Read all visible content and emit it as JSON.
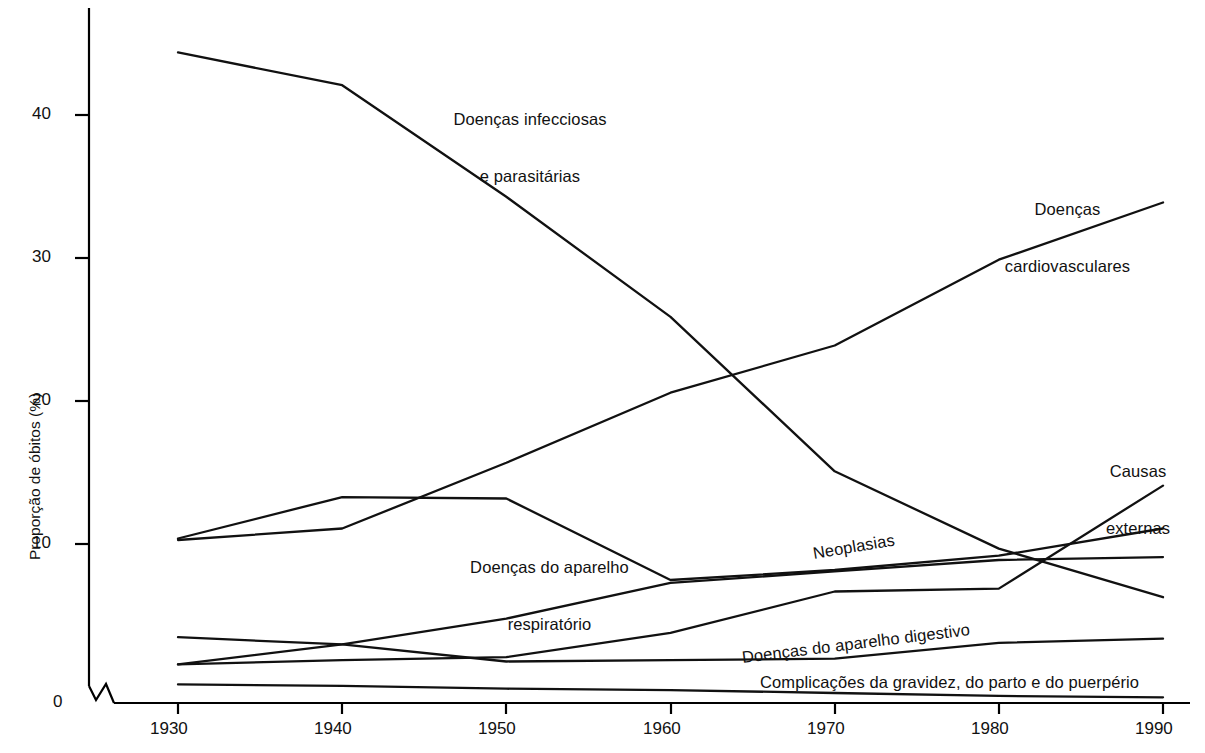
{
  "chart_data": {
    "type": "line",
    "title": "",
    "xlabel": "",
    "ylabel": "Proporção de óbitos (%)",
    "x": [
      1930,
      1940,
      1950,
      1960,
      1970,
      1980,
      1990
    ],
    "xticklabels": [
      "1930",
      "1940",
      "1950",
      "1960",
      "1970",
      "1980",
      "1990"
    ],
    "yticklabels": [
      "0",
      "10",
      "20",
      "30",
      "40"
    ],
    "yticks": [
      0,
      10,
      20,
      30,
      40
    ],
    "ylim": [
      0,
      46
    ],
    "xlim": [
      1930,
      1990
    ],
    "grid": false,
    "legend": "inline-annotations",
    "axis_break_y_origin": true,
    "series": [
      {
        "name": "Doenças infecciosas e parasitárias",
        "label": "Doenças infecciosas\ne parasitárias",
        "values": [
          45.5,
          43.2,
          35.4,
          27.0,
          16.2,
          10.8,
          7.4
        ]
      },
      {
        "name": "Doenças cardiovasculares",
        "label": "Doenças\ncardiovasculares",
        "values": [
          11.4,
          12.2,
          16.8,
          21.7,
          25.0,
          31.0,
          35.0
        ]
      },
      {
        "name": "Doenças do aparelho respiratório",
        "label": "Doenças do aparelho\nrespiratório",
        "values": [
          11.5,
          14.4,
          14.3,
          8.6,
          9.3,
          10.3,
          12.2
        ]
      },
      {
        "name": "Neoplasias",
        "label": "Neoplasias",
        "values": [
          2.7,
          4.1,
          5.9,
          8.4,
          9.2,
          10.0,
          10.2
        ]
      },
      {
        "name": "Doenças do aparelho digestivo",
        "label": "Doenças do aparelho digestivo",
        "values": [
          4.6,
          4.1,
          2.9,
          3.0,
          3.1,
          4.2,
          4.5
        ]
      },
      {
        "name": "Causas externas",
        "label": "Causas\nexternas",
        "values": [
          2.7,
          3.0,
          3.2,
          4.9,
          7.8,
          8.0,
          15.2
        ]
      },
      {
        "name": "Complicações da gravidez, do parto e do puerpério",
        "label": "Complicações da gravidez, do parto e do puerpério",
        "values": [
          1.3,
          1.2,
          1.0,
          0.9,
          0.7,
          0.5,
          0.4
        ]
      }
    ]
  },
  "axis": {
    "y_axis_title": "Proporção de óbitos (%)",
    "y_tick_0": "0",
    "y_tick_10": "10",
    "y_tick_20": "20",
    "y_tick_30": "30",
    "y_tick_40": "40",
    "x_tick_1930": "1930",
    "x_tick_1940": "1940",
    "x_tick_1950": "1950",
    "x_tick_1960": "1960",
    "x_tick_1970": "1970",
    "x_tick_1980": "1980",
    "x_tick_1990": "1990"
  },
  "annotations": {
    "infecciosas_line1": "Doenças infecciosas",
    "infecciosas_line2": "e parasitárias",
    "cardiovasculares_line1": "Doenças",
    "cardiovasculares_line2": "cardiovasculares",
    "causas_externas_line1": "Causas",
    "causas_externas_line2": "externas",
    "respiratorio_line1": "Doenças do aparelho",
    "respiratorio_line2": "respiratório",
    "neoplasias": "Neoplasias",
    "digestivo": "Doenças do aparelho digestivo",
    "gravidez": "Complicações da gravidez, do parto e do puerpério"
  },
  "style": {
    "line_color": "#111111",
    "background": "#ffffff",
    "axis_color": "#000000"
  }
}
